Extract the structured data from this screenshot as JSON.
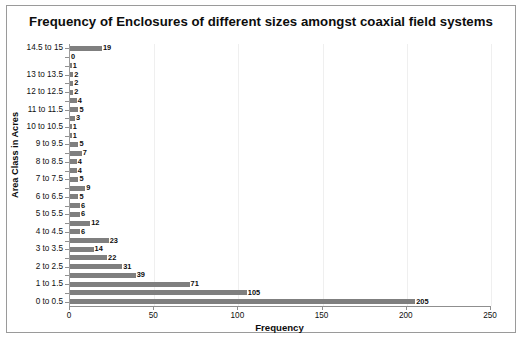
{
  "chart_data": {
    "type": "bar",
    "orientation": "horizontal",
    "title": "Frequency of Enclosures of different sizes amongst coaxial field systems",
    "xlabel": "Frequency",
    "ylabel": "Area Class in Acres",
    "xlim": [
      0,
      250
    ],
    "ylim_categories": 30,
    "grid": "vertical-faint",
    "legend": "none",
    "bar_color": "#7f7f7f",
    "xticks": [
      0,
      50,
      100,
      150,
      200,
      250
    ],
    "xticklabels": [
      "0",
      "50",
      "100",
      "150",
      "200",
      "250"
    ],
    "categories": [
      "0 to 0.5",
      "0.5 to 1",
      "1 to 1.5",
      "1.5 to 2",
      "2 to 2.5",
      "2.5 to 3",
      "3 to 3.5",
      "3.5 to 4",
      "4 to 4.5",
      "4.5 to 5",
      "5 to 5.5",
      "5.5 to 6",
      "6 to 6.5",
      "6.5 to 7",
      "7 to 7.5",
      "7.5 to 8",
      "8 to 8.5",
      "8.5 to 9",
      "9 to 9.5",
      "9.5 to 10",
      "10 to 10.5",
      "10.5 to 11",
      "11 to 11.5",
      "11.5 to 12",
      "12 to 12.5",
      "12.5 to 13",
      "13 to 13.5",
      "13.5 to 14",
      "14 to 14.5",
      "14.5 to 15"
    ],
    "values": [
      205,
      105,
      71,
      39,
      31,
      22,
      14,
      23,
      6,
      12,
      6,
      6,
      5,
      9,
      5,
      4,
      4,
      7,
      5,
      1,
      1,
      3,
      5,
      4,
      2,
      2,
      2,
      1,
      0,
      19
    ],
    "visible_ytick_labels": [
      "0 to 0.5",
      "1 to 1.5",
      "2 to 2.5",
      "3 to 3.5",
      "4 to 4.5",
      "5 to 5.5",
      "6 to 6.5",
      "7 to 7.5",
      "8 to 8.5",
      "9 to 9.5",
      "10 to 10.5",
      "11 to 11.5",
      "12 to 12.5",
      "13 to 13.5",
      "14.5 to 15"
    ]
  }
}
